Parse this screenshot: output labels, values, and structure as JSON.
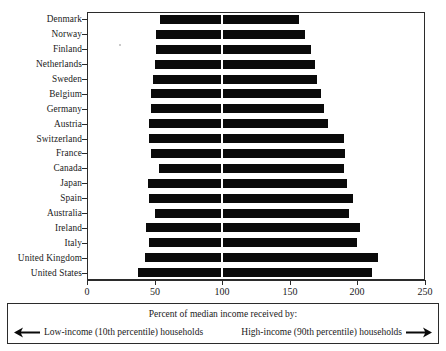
{
  "chart_data": {
    "type": "bar",
    "orientation": "horizontal",
    "subtype": "range-bar",
    "title": "",
    "xlabel": "Percent of median income received by:",
    "ylabel": "",
    "xlim": [
      0,
      250
    ],
    "xticks": [
      0,
      50,
      100,
      150,
      200,
      250
    ],
    "xtick_labels": [
      "0",
      "50",
      "100",
      "150",
      "200",
      "250"
    ],
    "grid": false,
    "legend_position": "bottom",
    "reference_value": 100,
    "bar_color": "#0a0a0a",
    "categories": [
      "Denmark",
      "Norway",
      "Finland",
      "Netherlands",
      "Sweden",
      "Belgium",
      "Germany",
      "Austria",
      "Switzerland",
      "France",
      "Canada",
      "Japan",
      "Spain",
      "Australia",
      "Ireland",
      "Italy",
      "United Kingdom",
      "United States"
    ],
    "series": [
      {
        "name": "Low-income (10th percentile) households",
        "values": [
          54,
          51,
          51,
          50,
          49,
          47,
          47,
          46,
          46,
          47,
          53,
          45,
          46,
          50,
          44,
          46,
          43,
          38
        ]
      },
      {
        "name": "High-income (90th percentile) households",
        "values": [
          157,
          161,
          166,
          169,
          170,
          173,
          175,
          178,
          190,
          191,
          190,
          192,
          197,
          194,
          202,
          200,
          215,
          211
        ]
      }
    ],
    "bars": [
      {
        "category": "Denmark",
        "low": 54,
        "high": 157
      },
      {
        "category": "Norway",
        "low": 51,
        "high": 161
      },
      {
        "category": "Finland",
        "low": 51,
        "high": 166
      },
      {
        "category": "Netherlands",
        "low": 50,
        "high": 169
      },
      {
        "category": "Sweden",
        "low": 49,
        "high": 170
      },
      {
        "category": "Belgium",
        "low": 47,
        "high": 173
      },
      {
        "category": "Germany",
        "low": 47,
        "high": 175
      },
      {
        "category": "Austria",
        "low": 46,
        "high": 178
      },
      {
        "category": "Switzerland",
        "low": 46,
        "high": 190
      },
      {
        "category": "France",
        "low": 47,
        "high": 191
      },
      {
        "category": "Canada",
        "low": 53,
        "high": 190
      },
      {
        "category": "Japan",
        "low": 45,
        "high": 192
      },
      {
        "category": "Spain",
        "low": 46,
        "high": 197
      },
      {
        "category": "Australia",
        "low": 50,
        "high": 194
      },
      {
        "category": "Ireland",
        "low": 44,
        "high": 202
      },
      {
        "category": "Italy",
        "low": 46,
        "high": 200
      },
      {
        "category": "United Kingdom",
        "low": 43,
        "high": 215
      },
      {
        "category": "United States",
        "low": 38,
        "high": 211
      }
    ]
  },
  "legend": {
    "title": "Percent of median income received by:",
    "left_label": "Low-income (10th percentile) households",
    "right_label": "High-income (90th percentile) households",
    "left_arrow_icon": "arrow-left-icon",
    "right_arrow_icon": "arrow-right-icon"
  }
}
